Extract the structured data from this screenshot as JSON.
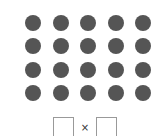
{
  "array": {
    "rows": 4,
    "cols": 5,
    "dot_color": "#555555"
  },
  "answer": {
    "operator": "×",
    "factor1_value": "",
    "factor2_value": ""
  }
}
